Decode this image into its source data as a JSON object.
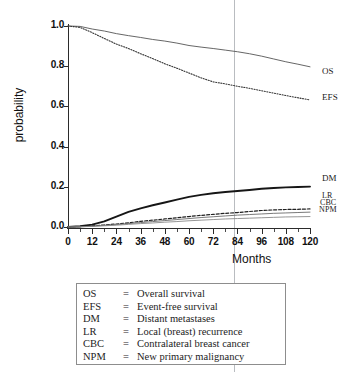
{
  "chart_data": {
    "type": "line",
    "title": "",
    "xlabel": "Months",
    "ylabel": "probability",
    "xlim": [
      0,
      120
    ],
    "ylim": [
      0.0,
      1.0
    ],
    "xticks": [
      0,
      12,
      24,
      36,
      48,
      60,
      72,
      84,
      96,
      108,
      120
    ],
    "xtick_labels": [
      "0",
      "12",
      "24",
      "36",
      "48",
      "60",
      "72",
      "84",
      "96",
      "108",
      "120"
    ],
    "xtick_minor_step": 6,
    "yticks": [
      0.0,
      0.2,
      0.4,
      0.6,
      0.8,
      1.0
    ],
    "ytick_labels": [
      "0.0",
      "0.2",
      "0.4",
      "0.6",
      "0.8",
      "1.0"
    ],
    "grid": false,
    "legend_position": "right-of-curve-end",
    "annotations": [
      {
        "name": "reference-line",
        "type": "vline",
        "x": 84,
        "color": "#b9bcc0"
      }
    ],
    "x": [
      0,
      6,
      12,
      18,
      24,
      30,
      36,
      42,
      48,
      54,
      60,
      66,
      72,
      78,
      84,
      90,
      96,
      102,
      108,
      114,
      120
    ],
    "series": [
      {
        "name": "OS",
        "label": "OS",
        "style": "solid-thin",
        "color": "#555555",
        "values": [
          1.0,
          0.998,
          0.985,
          0.975,
          0.962,
          0.952,
          0.943,
          0.933,
          0.925,
          0.915,
          0.903,
          0.895,
          0.888,
          0.88,
          0.872,
          0.862,
          0.85,
          0.836,
          0.822,
          0.81,
          0.797
        ]
      },
      {
        "name": "EFS",
        "label": "EFS",
        "style": "dotted",
        "color": "#333333",
        "values": [
          1.0,
          0.993,
          0.967,
          0.938,
          0.91,
          0.888,
          0.862,
          0.838,
          0.812,
          0.79,
          0.766,
          0.742,
          0.722,
          0.712,
          0.7,
          0.69,
          0.678,
          0.666,
          0.654,
          0.643,
          0.632
        ]
      },
      {
        "name": "DM",
        "label": "DM",
        "style": "solid-thick",
        "color": "#161616",
        "values": [
          0.0,
          0.004,
          0.012,
          0.028,
          0.052,
          0.075,
          0.093,
          0.108,
          0.122,
          0.136,
          0.15,
          0.16,
          0.168,
          0.174,
          0.179,
          0.184,
          0.19,
          0.194,
          0.197,
          0.199,
          0.201
        ]
      },
      {
        "name": "LR",
        "label": "LR",
        "style": "dashed",
        "color": "#1f1f1f",
        "values": [
          0.0,
          0.002,
          0.006,
          0.01,
          0.015,
          0.021,
          0.028,
          0.034,
          0.04,
          0.046,
          0.052,
          0.058,
          0.063,
          0.068,
          0.072,
          0.077,
          0.082,
          0.085,
          0.087,
          0.088,
          0.09
        ]
      },
      {
        "name": "CBC",
        "label": "CBC",
        "style": "solid-thin",
        "color": "#6a6a6a",
        "values": [
          0.0,
          0.001,
          0.004,
          0.008,
          0.012,
          0.017,
          0.022,
          0.027,
          0.032,
          0.037,
          0.042,
          0.047,
          0.051,
          0.055,
          0.059,
          0.062,
          0.065,
          0.068,
          0.07,
          0.072,
          0.074
        ]
      },
      {
        "name": "NPM",
        "label": "NPM",
        "style": "solid-thin",
        "color": "#8a8a8a",
        "values": [
          0.0,
          0.001,
          0.003,
          0.006,
          0.009,
          0.013,
          0.017,
          0.02,
          0.024,
          0.027,
          0.031,
          0.034,
          0.037,
          0.04,
          0.042,
          0.044,
          0.046,
          0.048,
          0.05,
          0.051,
          0.052
        ]
      }
    ]
  },
  "legend": {
    "rows": [
      {
        "abbr": "OS",
        "eq": "=",
        "desc": "Overall survival"
      },
      {
        "abbr": "EFS",
        "eq": "=",
        "desc": "Event-free survival"
      },
      {
        "abbr": "DM",
        "eq": "=",
        "desc": "Distant metastases"
      },
      {
        "abbr": "LR",
        "eq": "=",
        "desc": "Local (breast) recurrence"
      },
      {
        "abbr": "CBC",
        "eq": "=",
        "desc": "Contralateral breast cancer"
      },
      {
        "abbr": "NPM",
        "eq": "=",
        "desc": "New primary malignancy"
      }
    ]
  }
}
